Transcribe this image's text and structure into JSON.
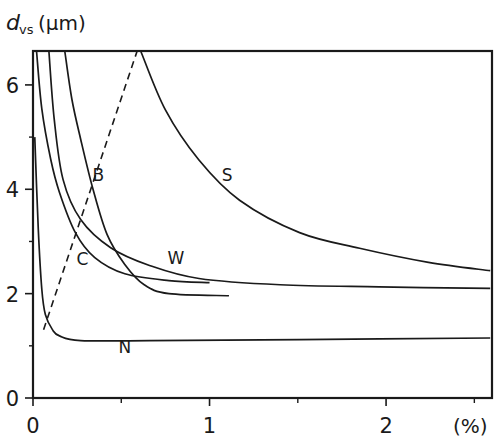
{
  "chart_data": {
    "type": "line",
    "title": "",
    "ylabel_main": "d",
    "ylabel_sub": "vs",
    "ylabel_unit": "(µm)",
    "xlabel": "(%)",
    "xlim": [
      0,
      2.6
    ],
    "ylim": [
      0,
      6.65
    ],
    "xticks_major": [
      0,
      1,
      2
    ],
    "xtick_labels": [
      "0",
      "1",
      "2"
    ],
    "xticks_minor": [
      0.5,
      1.5,
      2.5
    ],
    "yticks_major": [
      0,
      2,
      4,
      6
    ],
    "ytick_labels": [
      "0",
      "2",
      "4",
      "6"
    ],
    "yticks_minor": [
      1,
      3,
      5
    ],
    "grid": false,
    "legend": "inline labels",
    "series": [
      {
        "name": "C",
        "style": "solid",
        "label_pos": [
          0.28,
          2.55
        ],
        "x": [
          0.02,
          0.05,
          0.1,
          0.15,
          0.24,
          0.35,
          0.52,
          0.77,
          1.0
        ],
        "y": [
          6.65,
          5.54,
          4.58,
          3.94,
          3.17,
          2.69,
          2.38,
          2.25,
          2.21
        ]
      },
      {
        "name": "W",
        "style": "solid",
        "label_pos": [
          0.81,
          2.56
        ],
        "x": [
          0.09,
          0.12,
          0.17,
          0.27,
          0.44,
          0.66,
          0.94,
          1.4,
          1.96,
          2.59
        ],
        "y": [
          6.65,
          5.35,
          4.19,
          3.42,
          2.88,
          2.54,
          2.29,
          2.17,
          2.13,
          2.1
        ]
      },
      {
        "name": "B",
        "style": "solid",
        "label_pos": [
          0.37,
          4.15
        ],
        "x": [
          0.18,
          0.22,
          0.27,
          0.34,
          0.42,
          0.52,
          0.63,
          0.77,
          1.11
        ],
        "y": [
          6.65,
          5.73,
          4.96,
          4.0,
          3.13,
          2.56,
          2.17,
          2.0,
          1.96
        ]
      },
      {
        "name": "S",
        "style": "solid",
        "label_pos": [
          1.1,
          4.15
        ],
        "x": [
          0.61,
          0.75,
          0.94,
          1.17,
          1.51,
          1.85,
          2.24,
          2.59
        ],
        "y": [
          6.65,
          5.52,
          4.56,
          3.79,
          3.17,
          2.87,
          2.6,
          2.44
        ]
      },
      {
        "name": "N",
        "style": "solid",
        "label_pos": [
          0.52,
          0.87
        ],
        "x": [
          0.01,
          0.03,
          0.05,
          0.07,
          0.11,
          0.15,
          0.27,
          0.66,
          1.51,
          2.59
        ],
        "y": [
          5.0,
          3.23,
          2.08,
          1.6,
          1.31,
          1.19,
          1.1,
          1.1,
          1.12,
          1.15
        ]
      },
      {
        "name": "boundary",
        "style": "dashed",
        "label_pos": null,
        "x": [
          0.06,
          0.59
        ],
        "y": [
          1.31,
          6.65
        ]
      }
    ]
  }
}
